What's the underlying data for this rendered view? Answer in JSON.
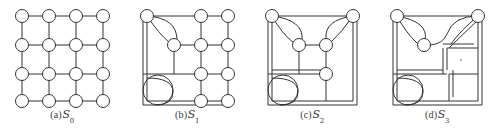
{
  "figure": {
    "type": "diagram",
    "background_color": "#ffffff",
    "stroke_color": "#333333",
    "node_fill": "#ffffff",
    "panel_count": 4
  },
  "panels": [
    {
      "id": "panel-a",
      "index_label": "(a)",
      "symbol": "S",
      "subscript": "0",
      "node_count": 16,
      "supernode_count": 0,
      "grid": {
        "rows": 4,
        "cols": 4
      }
    },
    {
      "id": "panel-b",
      "index_label": "(b)",
      "symbol": "S",
      "subscript": "1",
      "node_count": 9,
      "supernode_count": 1,
      "grid": {
        "rows": 4,
        "cols": 4
      }
    },
    {
      "id": "panel-c",
      "index_label": "(c)",
      "symbol": "S",
      "subscript": "2",
      "node_count": 5,
      "supernode_count": 2,
      "grid": {
        "rows": 4,
        "cols": 4
      }
    },
    {
      "id": "panel-d",
      "index_label": "(d)",
      "symbol": "S",
      "subscript": "3",
      "node_count": 3,
      "supernode_count": 3,
      "grid": {
        "rows": 4,
        "cols": 4
      }
    }
  ]
}
